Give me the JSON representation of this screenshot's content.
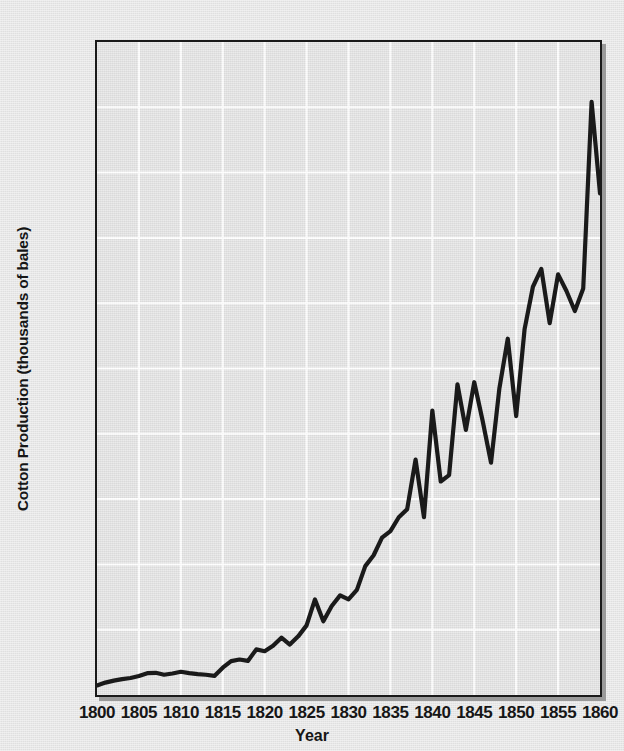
{
  "chart_data": {
    "type": "line",
    "title": "",
    "xlabel": "Year",
    "ylabel": "Cotton Production (thousands of bales)",
    "xlim": [
      1800,
      1860
    ],
    "ylim": [
      0,
      5000
    ],
    "grid": true,
    "legend": "none",
    "line_color": "#1a1a1a",
    "plot_bg_color": "#e1e1e1",
    "page_bg_color": "#e6e6e6",
    "gridline_color": "#ffffff",
    "axis_color": "#1a1a1a",
    "y_ticks": [
      "0",
      "500",
      "1,000",
      "1,500",
      "2,000",
      "2,500",
      "3,000",
      "3,500",
      "4,000",
      "4,500",
      "5,000"
    ],
    "y_tick_values": [
      0,
      500,
      1000,
      1500,
      2000,
      2500,
      3000,
      3500,
      4000,
      4500,
      5000
    ],
    "x_ticks": [
      "1800",
      "1805",
      "1810",
      "1815",
      "1820",
      "1825",
      "1830",
      "1835",
      "1840",
      "1845",
      "1850",
      "1855",
      "1860"
    ],
    "x_tick_values": [
      1800,
      1805,
      1810,
      1815,
      1820,
      1825,
      1830,
      1835,
      1840,
      1845,
      1850,
      1855,
      1860
    ],
    "series": [
      {
        "name": "Cotton Production",
        "x": [
          1800,
          1801,
          1802,
          1803,
          1804,
          1805,
          1806,
          1807,
          1808,
          1809,
          1810,
          1811,
          1812,
          1813,
          1814,
          1815,
          1816,
          1817,
          1818,
          1819,
          1820,
          1821,
          1822,
          1823,
          1824,
          1825,
          1826,
          1827,
          1828,
          1829,
          1830,
          1831,
          1832,
          1833,
          1834,
          1835,
          1836,
          1837,
          1838,
          1839,
          1840,
          1841,
          1842,
          1843,
          1844,
          1845,
          1846,
          1847,
          1848,
          1849,
          1850,
          1851,
          1852,
          1853,
          1854,
          1855,
          1856,
          1857,
          1858,
          1859,
          1860
        ],
        "values": [
          73,
          95,
          110,
          122,
          130,
          146,
          167,
          170,
          155,
          165,
          178,
          168,
          160,
          155,
          146,
          209,
          259,
          272,
          261,
          349,
          335,
          377,
          439,
          386,
          449,
          533,
          732,
          565,
          681,
          763,
          732,
          805,
          987,
          1070,
          1205,
          1255,
          1361,
          1423,
          1802,
          1361,
          2178,
          1635,
          1684,
          2379,
          2030,
          2395,
          2100,
          1779,
          2348,
          2728,
          2136,
          2799,
          3126,
          3263,
          2847,
          3221,
          3093,
          2940,
          3113,
          4541,
          3841
        ]
      }
    ]
  },
  "axes": {
    "ylabel_text": "Cotton Production (thousands of bales)",
    "xlabel_text": "Year"
  }
}
